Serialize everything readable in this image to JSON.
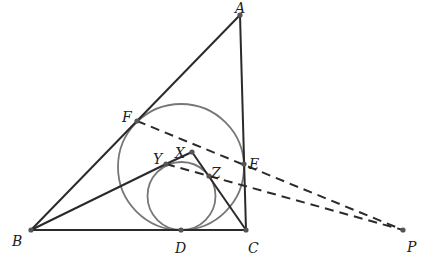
{
  "diagram": {
    "type": "geometry",
    "colors": {
      "line": "#2a2a2a",
      "circle": "#777777",
      "point": "#555555"
    },
    "points": [
      {
        "name": "A",
        "x": 240,
        "y": 15,
        "lx": 235,
        "ly": 8
      },
      {
        "name": "B",
        "x": 31,
        "y": 230,
        "lx": 12,
        "ly": 241
      },
      {
        "name": "C",
        "x": 246,
        "y": 230,
        "lx": 248,
        "ly": 248
      },
      {
        "name": "D",
        "x": 181,
        "y": 230,
        "lx": 175,
        "ly": 248
      },
      {
        "name": "E",
        "x": 244,
        "y": 164,
        "lx": 249,
        "ly": 164
      },
      {
        "name": "F",
        "x": 137,
        "y": 121,
        "lx": 122,
        "ly": 117
      },
      {
        "name": "X",
        "x": 192,
        "y": 152,
        "lx": 175,
        "ly": 153
      },
      {
        "name": "Y",
        "x": 166,
        "y": 164,
        "lx": 153,
        "ly": 159
      },
      {
        "name": "Z",
        "x": 209,
        "y": 176,
        "lx": 211,
        "ly": 173
      },
      {
        "name": "P",
        "x": 403,
        "y": 230,
        "lx": 407,
        "ly": 247
      }
    ],
    "segments": [
      {
        "from": "A",
        "to": "B",
        "style": "solid"
      },
      {
        "from": "A",
        "to": "C",
        "style": "solid"
      },
      {
        "from": "B",
        "to": "C",
        "style": "solid"
      },
      {
        "from": "B",
        "to": "Y",
        "style": "solid"
      },
      {
        "from": "Y",
        "to": "X",
        "style": "solid"
      },
      {
        "from": "X",
        "to": "C",
        "style": "solid"
      },
      {
        "from": "F",
        "to": "P",
        "style": "dashed"
      },
      {
        "from": "Y",
        "to": "P",
        "style": "dashed"
      }
    ],
    "circles": [
      {
        "name": "incircle",
        "cx": 181,
        "cy": 167,
        "r": 63
      },
      {
        "name": "inner-circle",
        "cx": 181.5,
        "cy": 196,
        "r": 34
      }
    ]
  }
}
